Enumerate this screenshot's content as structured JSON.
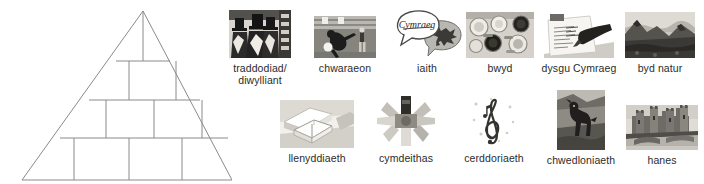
{
  "pyramid": {
    "name": "blank-pyramid-diagram",
    "tiers": 4,
    "cell_counts": [
      1,
      2,
      3,
      4
    ],
    "cells": [
      "",
      "",
      "",
      "",
      "",
      "",
      "",
      "",
      "",
      ""
    ],
    "stroke_color": "#8a8a8a",
    "fill_color": "#ffffff"
  },
  "topics": {
    "rows": [
      {
        "row_name": "topics-row-1",
        "items": [
          {
            "label": "traddodiad/\ndiwylliant",
            "icon": "welsh-costume-photo"
          },
          {
            "label": "chwaraeon",
            "icon": "football-player-photo"
          },
          {
            "label": "iaith",
            "icon": "speech-bubbles-icon",
            "bubble_text": "Cymraeg"
          },
          {
            "label": "bwyd",
            "icon": "food-bowls-photo"
          },
          {
            "label": "dysgu Cymraeg",
            "icon": "pen-writing-photo"
          },
          {
            "label": "byd natur",
            "icon": "mountain-landscape-photo"
          }
        ]
      },
      {
        "row_name": "topics-row-2",
        "items": [
          {
            "label": "llenyddiaeth",
            "icon": "open-book-photo"
          },
          {
            "label": "cymdeithas",
            "icon": "people-star-icon"
          },
          {
            "label": "cerddoriaeth",
            "icon": "treble-clef-icon"
          },
          {
            "label": "chwedloniaeth",
            "icon": "stone-animal-photo"
          },
          {
            "label": "hanes",
            "icon": "castle-photo"
          }
        ]
      }
    ]
  },
  "colors": {
    "text": "#2b2b2b",
    "line": "#8a8a8a",
    "background": "#ffffff"
  }
}
